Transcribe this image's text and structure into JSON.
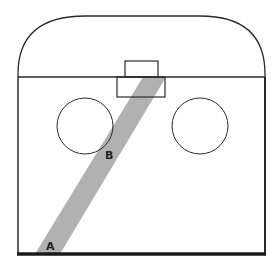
{
  "diagram": {
    "labels": {
      "point_a": "A",
      "point_b": "B"
    },
    "colors": {
      "stroke": "#2a2a2a",
      "band": "#a8a8a8",
      "background": "#ffffff",
      "label": "#222222"
    },
    "shapes": {
      "outer_enclosure": "rounded-top enclosure with flat sides and thick base",
      "divider_line": "horizontal line across enclosure",
      "upper_box": "small rectangle above divider",
      "lower_box": "wider rectangle below divider",
      "left_circle": "circle left",
      "right_circle": "circle right",
      "diagonal_band": "shaded diagonal band from A to lower box"
    }
  }
}
